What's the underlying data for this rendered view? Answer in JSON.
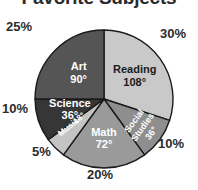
{
  "chart_data": {
    "type": "pie",
    "title": "Favorite Subjects",
    "xlabel": "",
    "ylabel": "",
    "legend_position": "none",
    "grid": false,
    "start_angle_deg": 0,
    "direction": "clockwise",
    "categories": [
      "Reading",
      "Social Studies",
      "Math",
      "Music",
      "Science",
      "Art"
    ],
    "values": [
      30,
      10,
      20,
      5,
      10,
      25
    ],
    "value_unit": "percent",
    "angles_deg": [
      108,
      36,
      72,
      18,
      36,
      90
    ],
    "slices": [
      {
        "name": "Reading",
        "label": "Reading",
        "degrees_text": "108°",
        "degrees": 108,
        "percent": 30,
        "percent_text": "30%",
        "color": "#c9c9c9",
        "label_color": "#1b1b1b",
        "label_rotation": 0
      },
      {
        "name": "Social Studies",
        "label": "Social\nStudies",
        "label_line1": "Social",
        "label_line2": "Studies",
        "degrees_text": "36°",
        "degrees": 36,
        "percent": 10,
        "percent_text": "10%",
        "color": "#8e8e8e",
        "label_color": "#ffffff",
        "label_rotation": -54
      },
      {
        "name": "Math",
        "label": "Math",
        "degrees_text": "72°",
        "degrees": 72,
        "percent": 20,
        "percent_text": "20%",
        "color": "#9a9a9a",
        "label_color": "#ffffff",
        "label_rotation": 0
      },
      {
        "name": "Music",
        "label": "Music",
        "degrees_text": "18°",
        "degrees": 18,
        "percent": 5,
        "percent_text": "5%",
        "color": "#c4c4c4",
        "label_color": "#ffffff",
        "label_rotation": -39
      },
      {
        "name": "Science",
        "label": "Science",
        "degrees_text": "36°",
        "degrees": 36,
        "percent": 10,
        "percent_text": "10%",
        "color": "#363636",
        "label_color": "#ffffff",
        "label_rotation": 0
      },
      {
        "name": "Art",
        "label": "Art",
        "degrees_text": "90°",
        "degrees": 90,
        "percent": 25,
        "percent_text": "25%",
        "color": "#555555",
        "label_color": "#ffffff",
        "label_rotation": 0
      }
    ],
    "outside_percent_labels": [
      {
        "text": "30%",
        "position": "top-right"
      },
      {
        "text": "10%",
        "position": "bottom-right"
      },
      {
        "text": "20%",
        "position": "bottom"
      },
      {
        "text": "5%",
        "position": "bottom-left"
      },
      {
        "text": "10%",
        "position": "left"
      },
      {
        "text": "25%",
        "position": "top-left"
      }
    ]
  }
}
